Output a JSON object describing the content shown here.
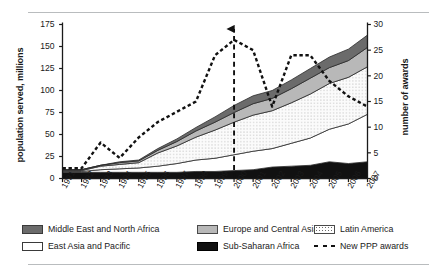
{
  "axes": {
    "y_left_title": "population served, millions",
    "y_right_title": "number of awards",
    "y_left_ticks": [
      "0",
      "25",
      "50",
      "75",
      "100",
      "125",
      "150",
      "175"
    ],
    "y_right_ticks": [
      "0",
      "5",
      "10",
      "15",
      "20",
      "25",
      "30"
    ],
    "x_ticks": [
      "1991",
      "1992",
      "1993",
      "1994",
      "1995",
      "1996",
      "1997",
      "1998",
      "1999",
      "2000",
      "2001",
      "2002",
      "2003",
      "2004",
      "2005",
      "2006",
      "2007"
    ]
  },
  "legend": {
    "items": [
      {
        "label": "Middle East and North Africa",
        "swatch": "mena-swatch",
        "color": "#6b6b6b"
      },
      {
        "label": "Europe and Central Asia",
        "swatch": "eca-swatch",
        "color": "#b8b8b8"
      },
      {
        "label": "Latin America",
        "swatch": "lac-swatch",
        "color": "#ffffff"
      },
      {
        "label": "East Asia and Pacific",
        "swatch": "eap-swatch",
        "color": "#ffffff"
      },
      {
        "label": "Sub-Saharan Africa",
        "swatch": "ssa-swatch",
        "color": "#111111"
      },
      {
        "label": "New PPP awards",
        "swatch": "ppp-dashed-line-swatch",
        "color": "#111111"
      }
    ]
  },
  "annotation": {
    "marker": "vertical-dashed-arrow",
    "at_year": "2000"
  },
  "chart_data": {
    "type": "area",
    "title": "",
    "subtitle": "",
    "xlabel": "",
    "ylabel": "population served, millions",
    "y2label": "number of awards",
    "ylim": [
      0,
      175
    ],
    "y2lim": [
      0,
      30
    ],
    "grid": false,
    "legend_position": "bottom",
    "stacked": true,
    "x": [
      "1991",
      "1992",
      "1993",
      "1994",
      "1995",
      "1996",
      "1997",
      "1998",
      "1999",
      "2000",
      "2001",
      "2002",
      "2003",
      "2004",
      "2005",
      "2006",
      "2007"
    ],
    "series": [
      {
        "name": "Sub-Saharan Africa",
        "axis": "left",
        "fill": "#111111",
        "values": [
          7,
          7,
          7,
          7,
          7,
          7,
          7,
          8,
          8,
          9,
          10,
          13,
          14,
          15,
          19,
          17,
          19
        ]
      },
      {
        "name": "East Asia and Pacific",
        "axis": "left",
        "fill": "#ffffff",
        "values": [
          1,
          1,
          3,
          4,
          5,
          7,
          10,
          13,
          15,
          18,
          21,
          21,
          26,
          31,
          37,
          45,
          54
        ]
      },
      {
        "name": "Latin America",
        "axis": "left",
        "fill": "#f2f2f2",
        "pattern": "stipple",
        "values": [
          1,
          1,
          4,
          5,
          6,
          15,
          20,
          26,
          32,
          37,
          41,
          43,
          46,
          50,
          52,
          53,
          54
        ]
      },
      {
        "name": "Europe and Central Asia",
        "axis": "left",
        "fill": "#b8b8b8",
        "values": [
          1,
          1,
          1,
          2,
          2,
          3,
          5,
          7,
          9,
          11,
          13,
          14,
          16,
          18,
          18,
          19,
          22
        ]
      },
      {
        "name": "Middle East and North Africa",
        "axis": "left",
        "fill": "#6b6b6b",
        "values": [
          0,
          0,
          0,
          1,
          1,
          2,
          3,
          4,
          6,
          8,
          9,
          9,
          10,
          11,
          12,
          13,
          14
        ]
      },
      {
        "name": "New PPP awards",
        "axis": "right",
        "style": "dashed-line",
        "color": "#111111",
        "values": [
          2,
          2,
          7,
          4,
          8,
          11,
          13,
          15,
          24,
          27,
          25,
          14,
          24,
          24,
          19,
          16,
          14
        ]
      }
    ]
  }
}
